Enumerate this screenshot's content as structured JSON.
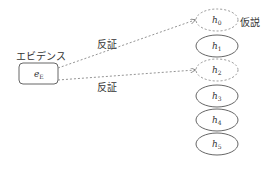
{
  "diagram": {
    "evidence": {
      "title": "エビデンス",
      "symbol": "e",
      "subscript": "E"
    },
    "edges": [
      {
        "label": "反証",
        "from": "evidence",
        "to": "h0",
        "style": "dashed"
      },
      {
        "label": "反証",
        "from": "evidence",
        "to": "h2",
        "style": "dashed"
      }
    ],
    "hypotheses": [
      {
        "symbol": "h",
        "subscript": "0",
        "style": "dashed"
      },
      {
        "symbol": "h",
        "subscript": "1",
        "style": "solid"
      },
      {
        "symbol": "h",
        "subscript": "2",
        "style": "dashed"
      },
      {
        "symbol": "h",
        "subscript": "3",
        "style": "solid"
      },
      {
        "symbol": "h",
        "subscript": "4",
        "style": "solid"
      },
      {
        "symbol": "h",
        "subscript": "5",
        "style": "solid"
      }
    ],
    "hypothesis_label": "仮説",
    "colors": {
      "stroke": "#555555",
      "dashed_stroke": "#888888",
      "text": "#333333"
    }
  }
}
